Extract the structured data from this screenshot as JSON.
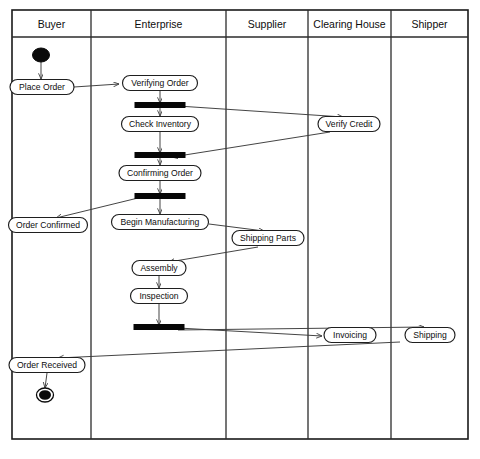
{
  "diagram": {
    "type": "uml-activity-swimlane",
    "caption": "",
    "frame": {
      "x": 12,
      "y": 10,
      "width": 456,
      "height": 429,
      "header_height": 27
    },
    "lanes": [
      {
        "id": "buyer",
        "label": "Buyer",
        "x": 12,
        "width": 79
      },
      {
        "id": "enterprise",
        "label": "Enterprise",
        "x": 91,
        "width": 135
      },
      {
        "id": "supplier",
        "label": "Supplier",
        "x": 226,
        "width": 82
      },
      {
        "id": "clearing-house",
        "label": "Clearing House",
        "x": 308,
        "width": 83
      },
      {
        "id": "shipper",
        "label": "Shipper",
        "x": 391,
        "width": 77
      }
    ],
    "nodes": [
      {
        "id": "start",
        "kind": "initial",
        "lane": "buyer",
        "label": "",
        "cx": 41,
        "cy": 55
      },
      {
        "id": "place-order",
        "kind": "activity",
        "lane": "buyer",
        "label": "Place Order",
        "cx": 42,
        "cy": 87,
        "w": 64,
        "h": 15
      },
      {
        "id": "verifying-order",
        "kind": "activity",
        "lane": "enterprise",
        "label": "Verifying Order",
        "cx": 160,
        "cy": 83,
        "w": 75,
        "h": 15
      },
      {
        "id": "fork-1",
        "kind": "bar",
        "lane": "enterprise",
        "label": "",
        "cx": 160,
        "cy": 105,
        "w": 50,
        "h": 5
      },
      {
        "id": "check-inventory",
        "kind": "activity",
        "lane": "enterprise",
        "label": "Check Inventory",
        "cx": 160,
        "cy": 124,
        "w": 77,
        "h": 15
      },
      {
        "id": "verify-credit",
        "kind": "activity",
        "lane": "clearing-house",
        "label": "Verify Credit",
        "cx": 349,
        "cy": 124,
        "w": 62,
        "h": 15
      },
      {
        "id": "join-1",
        "kind": "bar",
        "lane": "enterprise",
        "label": "",
        "cx": 160,
        "cy": 155,
        "w": 50,
        "h": 5
      },
      {
        "id": "confirming-order",
        "kind": "activity",
        "lane": "enterprise",
        "label": "Confirming Order",
        "cx": 160,
        "cy": 173,
        "w": 82,
        "h": 15
      },
      {
        "id": "fork-2",
        "kind": "bar",
        "lane": "enterprise",
        "label": "",
        "cx": 160,
        "cy": 196,
        "w": 50,
        "h": 5
      },
      {
        "id": "order-confirmed",
        "kind": "activity",
        "lane": "buyer",
        "label": "Order Confirmed",
        "cx": 48,
        "cy": 225,
        "w": 79,
        "h": 15
      },
      {
        "id": "begin-manufacturing",
        "kind": "activity",
        "lane": "enterprise",
        "label": "Begin Manufacturing",
        "cx": 160,
        "cy": 222,
        "w": 97,
        "h": 15
      },
      {
        "id": "shipping-parts",
        "kind": "activity",
        "lane": "supplier",
        "label": "Shipping Parts",
        "cx": 268,
        "cy": 238,
        "w": 72,
        "h": 15
      },
      {
        "id": "assembly",
        "kind": "activity",
        "lane": "enterprise",
        "label": "Assembly",
        "cx": 159,
        "cy": 268,
        "w": 54,
        "h": 15
      },
      {
        "id": "inspection",
        "kind": "activity",
        "lane": "enterprise",
        "label": "Inspection",
        "cx": 159,
        "cy": 296,
        "w": 57,
        "h": 15
      },
      {
        "id": "fork-3",
        "kind": "bar",
        "lane": "enterprise",
        "label": "",
        "cx": 159,
        "cy": 327,
        "w": 50,
        "h": 5
      },
      {
        "id": "invoicing",
        "kind": "activity",
        "lane": "clearing-house",
        "label": "Invoicing",
        "cx": 350,
        "cy": 335,
        "w": 52,
        "h": 15
      },
      {
        "id": "shipping",
        "kind": "activity",
        "lane": "shipper",
        "label": "Shipping",
        "cx": 430,
        "cy": 335,
        "w": 50,
        "h": 15
      },
      {
        "id": "order-received",
        "kind": "activity",
        "lane": "buyer",
        "label": "Order Received",
        "cx": 47,
        "cy": 365,
        "w": 76,
        "h": 15
      },
      {
        "id": "end",
        "kind": "final",
        "lane": "buyer",
        "label": "",
        "cx": 45,
        "cy": 395
      }
    ],
    "flows": [
      {
        "id": "f1",
        "from": "start",
        "to": "place-order",
        "path": "M41,62 L41,79",
        "arrow": true
      },
      {
        "id": "f2",
        "from": "place-order",
        "to": "verifying-order",
        "path": "M74,87 L119,84",
        "arrow": true
      },
      {
        "id": "f3",
        "from": "verifying-order",
        "to": "fork-1",
        "path": "M160,91 L160,103",
        "arrow": true
      },
      {
        "id": "f4",
        "from": "fork-1",
        "to": "check-inventory",
        "path": "M160,108 L160,116",
        "arrow": true
      },
      {
        "id": "f5",
        "from": "fork-1",
        "to": "verify-credit",
        "path": "M178,106 L343,117",
        "arrow": true
      },
      {
        "id": "f6",
        "from": "check-inventory",
        "to": "join-1",
        "path": "M160,132 L160,153",
        "arrow": true
      },
      {
        "id": "f7",
        "from": "verify-credit",
        "to": "join-1",
        "path": "M330,132 L172,157",
        "arrow": true
      },
      {
        "id": "f8",
        "from": "join-1",
        "to": "confirming-order",
        "path": "M160,158 L160,165",
        "arrow": true
      },
      {
        "id": "f9",
        "from": "confirming-order",
        "to": "fork-2",
        "path": "M160,181 L160,194",
        "arrow": true
      },
      {
        "id": "f10",
        "from": "fork-2",
        "to": "order-confirmed",
        "path": "M138,198 L56,218",
        "arrow": true
      },
      {
        "id": "f11",
        "from": "fork-2",
        "to": "begin-manufacturing",
        "path": "M160,199 L160,214",
        "arrow": true
      },
      {
        "id": "f12",
        "from": "begin-manufacturing",
        "to": "shipping-parts",
        "path": "M209,224 L264,231",
        "arrow": true
      },
      {
        "id": "f13",
        "from": "shipping-parts",
        "to": "assembly",
        "path": "M258,247 L169,262",
        "arrow": true
      },
      {
        "id": "f14",
        "from": "assembly",
        "to": "inspection",
        "path": "M159,276 L159,288",
        "arrow": true
      },
      {
        "id": "f15",
        "from": "inspection",
        "to": "fork-3",
        "path": "M159,304 L159,325",
        "arrow": true
      },
      {
        "id": "f16",
        "from": "fork-3",
        "to": "invoicing",
        "path": "M178,328 L322,336",
        "arrow": true
      },
      {
        "id": "f17",
        "from": "fork-3",
        "to": "shipping",
        "path": "M178,330 L424,327",
        "arrow": true
      },
      {
        "id": "f18",
        "from": "invoicing",
        "to": "order-received",
        "path": "M400,342 L58,358",
        "arrow": true
      },
      {
        "id": "f19",
        "from": "order-received",
        "to": "end",
        "path": "M47,373 L45,388",
        "arrow": true
      }
    ]
  }
}
